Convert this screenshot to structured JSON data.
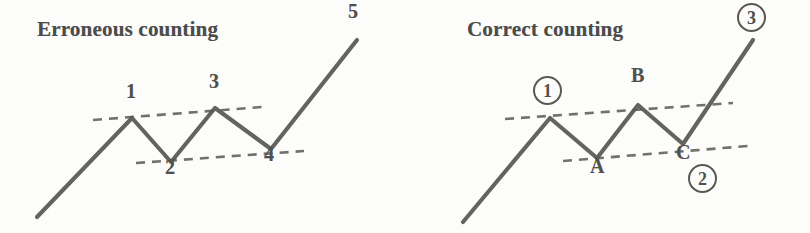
{
  "figure": {
    "background_color": "#fdfdfc",
    "stroke_color": "#54534f",
    "dash_color": "#5a5a56",
    "text_color": "#4d4d4a"
  },
  "panels": [
    {
      "id": "erroneous",
      "title": "Erroneous counting",
      "labels": [
        {
          "text": "1",
          "style": "plain"
        },
        {
          "text": "2",
          "style": "plain"
        },
        {
          "text": "3",
          "style": "plain"
        },
        {
          "text": "4",
          "style": "plain"
        },
        {
          "text": "5",
          "style": "plain"
        }
      ]
    },
    {
      "id": "correct",
      "title": "Correct counting",
      "labels": [
        {
          "text": "1",
          "style": "circled"
        },
        {
          "text": "A",
          "style": "plain"
        },
        {
          "text": "B",
          "style": "plain"
        },
        {
          "text": "C",
          "style": "plain"
        },
        {
          "text": "2",
          "style": "circled"
        },
        {
          "text": "3",
          "style": "circled"
        }
      ]
    }
  ],
  "chart_data": {
    "type": "line",
    "xlabel": "",
    "ylabel": "",
    "note": "Two schematic price zigzags drawn in screen pixel coordinates (y increases downward). Identical price path, two different wave counts.",
    "charts": [
      {
        "name": "Erroneous counting",
        "series": [
          {
            "name": "price-path",
            "points": [
              {
                "x": 37,
                "y": 217,
                "label": ""
              },
              {
                "x": 132,
                "y": 118,
                "label": "1"
              },
              {
                "x": 171,
                "y": 162,
                "label": "2"
              },
              {
                "x": 215,
                "y": 108,
                "label": "3"
              },
              {
                "x": 271,
                "y": 149,
                "label": "4"
              },
              {
                "x": 357,
                "y": 40,
                "label": "5"
              }
            ]
          }
        ],
        "trendlines": [
          {
            "name": "upper-resistance",
            "x1": 93,
            "y1": 120,
            "x2": 262,
            "y2": 107
          },
          {
            "name": "lower-support",
            "x1": 136,
            "y1": 163,
            "x2": 304,
            "y2": 151
          }
        ],
        "label_positions": [
          {
            "text": "1",
            "x": 126,
            "y": 90,
            "style": "plain"
          },
          {
            "text": "2",
            "x": 165,
            "y": 166,
            "style": "plain"
          },
          {
            "text": "3",
            "x": 209,
            "y": 80,
            "style": "plain"
          },
          {
            "text": "4",
            "x": 264,
            "y": 153,
            "style": "plain"
          },
          {
            "text": "5",
            "x": 348,
            "y": 8,
            "style": "plain"
          }
        ]
      },
      {
        "name": "Correct counting",
        "series": [
          {
            "name": "price-path",
            "points": [
              {
                "x": 463,
                "y": 222,
                "label": ""
              },
              {
                "x": 550,
                "y": 118,
                "label": "1"
              },
              {
                "x": 597,
                "y": 158,
                "label": "A"
              },
              {
                "x": 638,
                "y": 105,
                "label": "B"
              },
              {
                "x": 683,
                "y": 144,
                "label": "C"
              },
              {
                "x": 753,
                "y": 40,
                "label": "3"
              }
            ]
          }
        ],
        "trendlines": [
          {
            "name": "upper-resistance",
            "x1": 505,
            "y1": 119,
            "x2": 733,
            "y2": 103
          },
          {
            "name": "lower-support",
            "x1": 563,
            "y1": 161,
            "x2": 748,
            "y2": 146
          }
        ],
        "label_positions": [
          {
            "text": "1",
            "x": 534,
            "y": 80,
            "style": "circled"
          },
          {
            "text": "A",
            "x": 590,
            "y": 163,
            "style": "plain"
          },
          {
            "text": "B",
            "x": 631,
            "y": 72,
            "style": "plain"
          },
          {
            "text": "C",
            "x": 676,
            "y": 148,
            "style": "plain"
          },
          {
            "text": "2",
            "x": 688,
            "y": 168,
            "style": "circled"
          },
          {
            "text": "3",
            "x": 737,
            "y": 6,
            "style": "circled"
          }
        ]
      }
    ]
  }
}
